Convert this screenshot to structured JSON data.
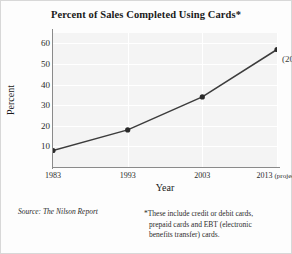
{
  "chart_data": {
    "type": "line",
    "title": "Percent of Sales Completed Using Cards*",
    "xlabel": "Year",
    "ylabel": "Percent",
    "categories": [
      "1983",
      "1993",
      "2003",
      "2013 (projected)"
    ],
    "x": [
      1983,
      1993,
      2003,
      2013
    ],
    "values": [
      8,
      18,
      34,
      57
    ],
    "series": [
      {
        "name": "Percent of sales completed using cards",
        "values": [
          8,
          18,
          34,
          57
        ]
      }
    ],
    "xlim": [
      1983,
      2013
    ],
    "ylim": [
      0,
      65
    ],
    "ytick_labels": [
      "10",
      "20",
      "30",
      "40",
      "50",
      "60"
    ],
    "ytick_values": [
      10,
      20,
      30,
      40,
      50,
      60
    ],
    "xtick_labels": [
      "1983",
      "1993",
      "2003",
      "2013"
    ],
    "grid": "white horizontal and vertical gridlines on light gray plot background",
    "legend": "none",
    "annotations": [
      {
        "text": "(2013, 57)",
        "x": 2013,
        "y": 57
      }
    ],
    "line_color": "#3c3c3c",
    "marker_color": "#2a2a2a",
    "plot_background": "#f4f4f4",
    "axis_color": "#8a8a8a"
  },
  "axis": {
    "y_title": "Percent",
    "x_title": "Year",
    "x_projected_suffix": "(projected)"
  },
  "footer": {
    "source": "Source: The Nilson Report",
    "footnote_lines": [
      "*These include credit or debit cards,",
      "prepaid cards and EBT (electronic",
      "benefits transfer) cards."
    ]
  }
}
